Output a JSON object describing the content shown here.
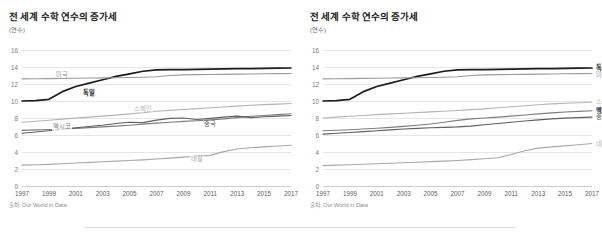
{
  "meta": {
    "colors": {
      "germany": "#1c1c1c",
      "usa": "#9a9a9a",
      "spain": "#b4b4b4",
      "mexico": "#7c7c7c",
      "china": "#5e5e5e",
      "nepal": "#a8a8a8",
      "grid": "#e6e6e6",
      "axis_text": "#7a7a7a",
      "title": "#1a1a1a"
    }
  },
  "panels": [
    {
      "id": "left",
      "title": "전 세계 수학 연수의 증가세",
      "unit": "(연수)",
      "source": "출처: Our World in Data",
      "label_mode": "inline"
    },
    {
      "id": "right",
      "title": "전 세계 수학 연수의 증가세",
      "unit": "(연수)",
      "source": "출처: Our World in Data",
      "label_mode": "edge"
    }
  ],
  "chart_data": [
    {
      "type": "line",
      "panel": "left",
      "title": "전 세계 수학 연수의 증가세",
      "subtitle": "(연수)",
      "xlabel": "",
      "ylabel": "(연수)",
      "ylim": [
        0,
        16
      ],
      "xlim": [
        1997,
        2017
      ],
      "yticks": [
        0,
        2,
        4,
        6,
        8,
        10,
        12,
        14,
        16
      ],
      "xticks": [
        1997,
        1999,
        2001,
        2003,
        2005,
        2007,
        2009,
        2011,
        2013,
        2015,
        2017
      ],
      "grid": true,
      "legend_position": "inline-on-line",
      "source": "출처: Our World in Data",
      "x": [
        1997,
        1998,
        1999,
        2000,
        2001,
        2002,
        2003,
        2004,
        2005,
        2006,
        2007,
        2008,
        2009,
        2010,
        2011,
        2012,
        2013,
        2014,
        2015,
        2016,
        2017
      ],
      "series": [
        {
          "name": "독일",
          "color": "#1c1c1c",
          "label_x": 2002,
          "label_y": 11.0,
          "values": [
            10.0,
            10.05,
            10.2,
            11.1,
            11.7,
            12.1,
            12.5,
            12.9,
            13.2,
            13.5,
            13.65,
            13.7,
            13.7,
            13.72,
            13.75,
            13.78,
            13.8,
            13.82,
            13.85,
            13.87,
            13.88
          ]
        },
        {
          "name": "미국",
          "color": "#9a9a9a",
          "label_x": 2000,
          "label_y": 13.1,
          "values": [
            12.6,
            12.62,
            12.64,
            12.66,
            12.68,
            12.7,
            12.72,
            12.74,
            12.76,
            12.8,
            12.85,
            13.0,
            13.08,
            13.1,
            13.12,
            13.14,
            13.16,
            13.18,
            13.2,
            13.22,
            13.24
          ]
        },
        {
          "name": "스페인",
          "color": "#b4b4b4",
          "label_x": 2006,
          "label_y": 9.1,
          "values": [
            7.5,
            7.62,
            7.74,
            7.86,
            7.98,
            8.1,
            8.22,
            8.34,
            8.48,
            8.62,
            8.8,
            8.9,
            9.0,
            9.1,
            9.2,
            9.3,
            9.4,
            9.5,
            9.58,
            9.64,
            9.7
          ]
        },
        {
          "name": "멕시코",
          "color": "#7c7c7c",
          "label_x": 2000,
          "label_y": 6.9,
          "values": [
            6.55,
            6.6,
            6.65,
            6.7,
            6.78,
            6.86,
            6.95,
            7.05,
            7.15,
            7.28,
            7.4,
            7.5,
            7.6,
            7.68,
            7.78,
            7.9,
            8.05,
            8.2,
            8.3,
            8.4,
            8.5
          ]
        },
        {
          "name": "중국",
          "color": "#5e5e5e",
          "label_x": 2011,
          "label_y": 7.3,
          "values": [
            6.2,
            6.35,
            6.5,
            6.68,
            6.85,
            7.0,
            7.15,
            7.35,
            7.5,
            7.45,
            7.75,
            7.95,
            8.0,
            7.82,
            7.95,
            8.1,
            8.22,
            8.05,
            8.15,
            8.22,
            8.3
          ]
        },
        {
          "name": "네팔",
          "color": "#a8a8a8",
          "label_x": 2010,
          "label_y": 3.2,
          "values": [
            2.45,
            2.5,
            2.55,
            2.62,
            2.7,
            2.78,
            2.85,
            2.92,
            3.0,
            3.08,
            3.18,
            3.28,
            3.4,
            3.5,
            3.6,
            4.05,
            4.35,
            4.5,
            4.6,
            4.7,
            4.8
          ]
        }
      ]
    },
    {
      "type": "line",
      "panel": "right",
      "title": "전 세계 수학 연수의 증가세",
      "subtitle": "(연수)",
      "xlabel": "",
      "ylabel": "(연수)",
      "ylim": [
        0,
        16
      ],
      "xlim": [
        1997,
        2017
      ],
      "yticks": [
        0,
        2,
        4,
        6,
        8,
        10,
        12,
        14,
        16
      ],
      "xticks": [
        1997,
        1999,
        2001,
        2003,
        2005,
        2007,
        2009,
        2011,
        2013,
        2015,
        2017
      ],
      "grid": true,
      "legend_position": "right-edge",
      "source": "출처: Our World in Data",
      "x": [
        1997,
        1998,
        1999,
        2000,
        2001,
        2002,
        2003,
        2004,
        2005,
        2006,
        2007,
        2008,
        2009,
        2010,
        2011,
        2012,
        2013,
        2014,
        2015,
        2016,
        2017
      ],
      "series": [
        {
          "name": "독일",
          "color": "#1c1c1c",
          "emphasis": true,
          "edge_y": 13.9,
          "values": [
            10.0,
            10.05,
            10.2,
            11.1,
            11.7,
            12.1,
            12.5,
            12.9,
            13.2,
            13.5,
            13.65,
            13.7,
            13.7,
            13.72,
            13.75,
            13.78,
            13.8,
            13.82,
            13.85,
            13.87,
            13.88
          ]
        },
        {
          "name": "미국",
          "color": "#9a9a9a",
          "emphasis": false,
          "edge_y": 13.1,
          "values": [
            12.6,
            12.62,
            12.64,
            12.66,
            12.68,
            12.7,
            12.72,
            12.74,
            12.76,
            12.8,
            12.85,
            13.0,
            13.08,
            13.1,
            13.12,
            13.14,
            13.16,
            13.18,
            13.2,
            13.22,
            13.24
          ]
        },
        {
          "name": "스페인",
          "color": "#b4b4b4",
          "emphasis": false,
          "edge_y": 9.85,
          "values": [
            8.0,
            8.1,
            8.2,
            8.3,
            8.4,
            8.48,
            8.56,
            8.64,
            8.72,
            8.8,
            8.88,
            8.98,
            9.08,
            9.2,
            9.32,
            9.44,
            9.56,
            9.66,
            9.74,
            9.8,
            9.85
          ]
        },
        {
          "name": "멕시코",
          "color": "#7c7c7c",
          "emphasis": true,
          "edge_y": 8.85,
          "values": [
            6.5,
            6.56,
            6.62,
            6.7,
            6.8,
            6.9,
            7.02,
            7.15,
            7.3,
            7.5,
            7.72,
            7.9,
            8.0,
            8.1,
            8.22,
            8.35,
            8.48,
            8.6,
            8.7,
            8.78,
            8.85
          ]
        },
        {
          "name": "중국",
          "color": "#5e5e5e",
          "emphasis": false,
          "edge_y": 8.1,
          "values": [
            6.1,
            6.2,
            6.3,
            6.4,
            6.5,
            6.6,
            6.7,
            6.78,
            6.85,
            6.9,
            6.95,
            7.05,
            7.2,
            7.35,
            7.5,
            7.65,
            7.78,
            7.9,
            7.98,
            8.04,
            8.1
          ]
        },
        {
          "name": "네팔",
          "color": "#a8a8a8",
          "emphasis": false,
          "edge_y": 5.0,
          "values": [
            2.4,
            2.45,
            2.5,
            2.56,
            2.62,
            2.68,
            2.74,
            2.8,
            2.86,
            2.92,
            3.0,
            3.1,
            3.2,
            3.32,
            3.7,
            4.15,
            4.45,
            4.6,
            4.72,
            4.85,
            5.0
          ]
        }
      ]
    }
  ]
}
